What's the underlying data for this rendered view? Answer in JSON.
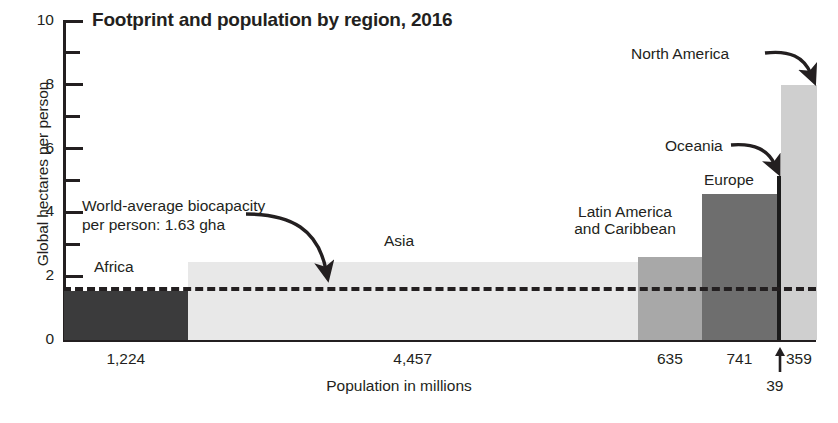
{
  "chart_data": {
    "type": "bar",
    "title": "Footprint and population by region, 2016",
    "xlabel": "Population in millions",
    "ylabel": "Global hectares per person",
    "ylim": [
      0,
      10
    ],
    "ytick_labels": [
      "0",
      "2",
      "4",
      "6",
      "8",
      "10"
    ],
    "ytick_values": [
      0,
      2,
      4,
      6,
      8,
      10
    ],
    "yminor_values": [
      1,
      3,
      5,
      7,
      9
    ],
    "grid": false,
    "legend": "none",
    "note": "Bar width is proportional to population; bar height is ecological footprint in global hectares per person.",
    "categories": [
      "Africa",
      "Asia",
      "Latin America and Caribbean",
      "Europe",
      "Oceania",
      "North America"
    ],
    "values": [
      1.55,
      2.45,
      2.6,
      4.58,
      5.15,
      8.0
    ],
    "widths": [
      1224,
      4457,
      635,
      741,
      39,
      359
    ],
    "population_labels": [
      "1,224",
      "4,457",
      "635",
      "741",
      "39",
      "359"
    ],
    "reference_line": {
      "label": "World-average biocapacity per person: 1.63 gha",
      "label_line1": "World-average biocapacity",
      "label_line2": "per person: 1.63 gha",
      "value": 1.63,
      "style": "dashed"
    },
    "bars": [
      {
        "name": "Africa",
        "value": 1.55,
        "population": 1224,
        "population_label": "1,224",
        "color": "#3b3b3c",
        "label": "Africa",
        "label_position": "above-inside"
      },
      {
        "name": "Asia",
        "value": 2.45,
        "population": 4457,
        "population_label": "4,457",
        "color": "#e8e8e8",
        "label": "Asia",
        "label_position": "above-inside"
      },
      {
        "name": "Latin America and Caribbean",
        "value": 2.6,
        "population": 635,
        "population_label": "635",
        "color": "#a8a8a8",
        "label": "Latin America and Caribbean",
        "label_position": "left-outside"
      },
      {
        "name": "Europe",
        "value": 4.58,
        "population": 741,
        "population_label": "741",
        "color": "#6e6e6e",
        "label": "Europe",
        "label_position": "above"
      },
      {
        "name": "Oceania",
        "value": 5.15,
        "population": 39,
        "population_label": "39",
        "color": "#1b1b1b",
        "label": "Oceania",
        "label_position": "callout"
      },
      {
        "name": "North America",
        "value": 8.0,
        "population": 359,
        "population_label": "359",
        "color": "#cfcfcf",
        "label": "North America",
        "label_position": "callout"
      }
    ]
  },
  "annotations": {
    "north_america": "North America",
    "oceania": "Oceania",
    "europe": "Europe",
    "latin_america_line1": "Latin America",
    "latin_america_line2": "and Caribbean",
    "asia": "Asia",
    "africa": "Africa"
  },
  "colors": {
    "ink": "#231f20",
    "background": "#ffffff",
    "africa": "#3b3b3c",
    "asia": "#e8e8e8",
    "latin_america": "#a8a8a8",
    "europe": "#6e6e6e",
    "oceania": "#1b1b1b",
    "north_america": "#cfcfcf"
  }
}
